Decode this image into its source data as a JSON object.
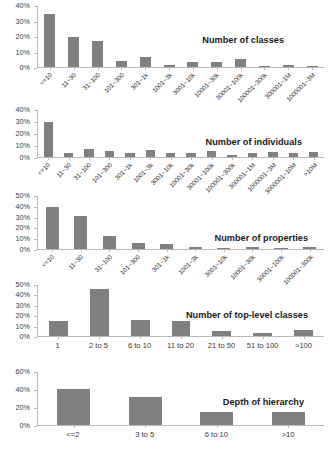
{
  "figure": {
    "background": "#ffffff",
    "bar_color": "#808080",
    "axis_color": "#b9b9b9",
    "text_color": "#3a3a3a"
  },
  "chart_data": [
    {
      "id": "number-of-classes",
      "type": "bar",
      "title": "Number of classes",
      "xlabel": "",
      "ylabel": "",
      "ylim": [
        0,
        40
      ],
      "yticks": [
        "0%",
        "10%",
        "20%",
        "30%",
        "40%"
      ],
      "ytick_values": [
        0,
        10,
        20,
        30,
        40
      ],
      "grid": false,
      "legend": "none",
      "categories": [
        "<=10",
        "11~30",
        "31~100",
        "101~300",
        "301~1k",
        "1001~3k",
        "3001~10k",
        "10001~30k",
        "30001~100k",
        "100001~300k",
        "300001~1M",
        "1000001~3M"
      ],
      "values": [
        34.5,
        19.5,
        16.5,
        4.0,
        6.5,
        1.5,
        3.5,
        3.0,
        5.0,
        0.8,
        1.0,
        0.5
      ]
    },
    {
      "id": "number-of-individuals",
      "type": "bar",
      "title": "Number of individuals",
      "xlabel": "",
      "ylabel": "",
      "ylim": [
        0,
        40
      ],
      "yticks": [
        "0%",
        "10%",
        "20%",
        "30%",
        "40%"
      ],
      "ytick_values": [
        0,
        10,
        20,
        30,
        40
      ],
      "grid": false,
      "legend": "none",
      "categories": [
        "<=10",
        "11~30",
        "31~100",
        "101~300",
        "301~1k",
        "1001~3k",
        "3001~10k",
        "10001~30k",
        "30001~100k",
        "100001~300k",
        "300001~1M",
        "1000001~3M",
        "3000001~10M",
        ">10M"
      ],
      "values": [
        29.5,
        3.5,
        7.0,
        5.0,
        3.5,
        6.0,
        3.0,
        3.0,
        5.0,
        1.5,
        3.0,
        4.0,
        3.0,
        4.0
      ]
    },
    {
      "id": "number-of-properties",
      "type": "bar",
      "title": "Number of properties",
      "xlabel": "",
      "ylabel": "",
      "ylim": [
        0,
        50
      ],
      "yticks": [
        "0%",
        "10%",
        "20%",
        "30%",
        "40%",
        "50%"
      ],
      "ytick_values": [
        0,
        10,
        20,
        30,
        40,
        50
      ],
      "grid": false,
      "legend": "none",
      "categories": [
        "<=10",
        "11~30",
        "31~100",
        "101~300",
        "301~1k",
        "1001~3k",
        "3001~10k",
        "10001~30k",
        "30001~100k",
        "100001~300k"
      ],
      "values": [
        38.5,
        30.5,
        12.5,
        5.5,
        5.0,
        1.5,
        0.4,
        2.0,
        0.3,
        1.8
      ]
    },
    {
      "id": "number-of-top-level-classes",
      "type": "bar",
      "title": "Number of top-level classes",
      "xlabel": "",
      "ylabel": "",
      "ylim": [
        0,
        50
      ],
      "yticks": [
        "0%",
        "10%",
        "20%",
        "30%",
        "40%",
        "50%"
      ],
      "ytick_values": [
        0,
        10,
        20,
        30,
        40,
        50
      ],
      "grid": false,
      "legend": "none",
      "categories": [
        "1",
        "2 to 5",
        "6 to 10",
        "11 to 20",
        "21 to 50",
        "51 to 100",
        ">100"
      ],
      "values": [
        14.0,
        45.0,
        15.5,
        14.5,
        5.0,
        2.5,
        6.0
      ]
    },
    {
      "id": "depth-of-hierarchy",
      "type": "bar",
      "title": "Depth of hierarchy",
      "xlabel": "",
      "ylabel": "",
      "ylim": [
        0,
        60
      ],
      "yticks": [
        "0%",
        "20%",
        "40%",
        "60%"
      ],
      "ytick_values": [
        0,
        20,
        40,
        60
      ],
      "grid": false,
      "legend": "none",
      "categories": [
        "<=2",
        "3 to 5",
        "6 to 10",
        ">10"
      ],
      "values": [
        40.0,
        31.0,
        15.0,
        15.0
      ]
    }
  ]
}
